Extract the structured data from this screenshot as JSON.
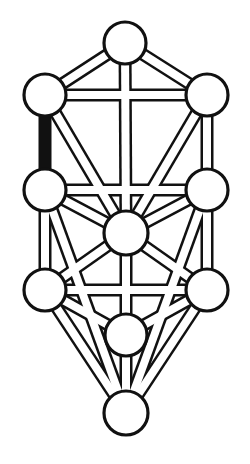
{
  "diagram": {
    "type": "kabbalistic-tree-of-life",
    "background_color": "#ffffff",
    "stroke_color": "#111111",
    "fill_color": "#ffffff",
    "highlight_color": "#111111",
    "canvas": {
      "width": 250,
      "height": 464
    },
    "node_radius": 20,
    "node_radius_bottom": 22,
    "path_outer_width": 13,
    "path_inner_width": 8,
    "node_stroke_width": 3.2,
    "path_stroke_width": 2.6
  },
  "nodes": [
    {
      "id": "kether",
      "label": "Kether",
      "number": 1,
      "cx": 125,
      "cy": 43,
      "r": 21,
      "pillar": "middle"
    },
    {
      "id": "chokmah",
      "label": "Chokmah",
      "number": 2,
      "cx": 207,
      "cy": 95,
      "r": 21,
      "pillar": "right"
    },
    {
      "id": "binah",
      "label": "Binah",
      "number": 3,
      "cx": 45,
      "cy": 95,
      "r": 21,
      "pillar": "left"
    },
    {
      "id": "chesed",
      "label": "Chesed",
      "number": 4,
      "cx": 207,
      "cy": 190,
      "r": 21,
      "pillar": "right"
    },
    {
      "id": "geburah",
      "label": "Geburah",
      "number": 5,
      "cx": 45,
      "cy": 190,
      "r": 21,
      "pillar": "left"
    },
    {
      "id": "tiphereth",
      "label": "Tiphereth",
      "number": 6,
      "cx": 126,
      "cy": 233,
      "r": 22,
      "pillar": "middle"
    },
    {
      "id": "netzach",
      "label": "Netzach",
      "number": 7,
      "cx": 207,
      "cy": 290,
      "r": 21,
      "pillar": "right"
    },
    {
      "id": "hod",
      "label": "Hod",
      "number": 8,
      "cx": 45,
      "cy": 290,
      "r": 21,
      "pillar": "left"
    },
    {
      "id": "yesod",
      "label": "Yesod",
      "number": 9,
      "cx": 126,
      "cy": 335,
      "r": 21,
      "pillar": "middle"
    },
    {
      "id": "malkuth",
      "label": "Malkuth",
      "number": 10,
      "cx": 126,
      "cy": 413,
      "r": 22,
      "pillar": "middle"
    }
  ],
  "paths": [
    {
      "id": "p-kether-binah",
      "from": "kether",
      "to": "binah",
      "highlighted": false
    },
    {
      "id": "p-kether-chokmah",
      "from": "kether",
      "to": "chokmah",
      "highlighted": false
    },
    {
      "id": "p-kether-tiphereth",
      "from": "kether",
      "to": "tiphereth",
      "highlighted": false
    },
    {
      "id": "p-binah-chokmah",
      "from": "binah",
      "to": "chokmah",
      "highlighted": false
    },
    {
      "id": "p-binah-geburah",
      "from": "binah",
      "to": "geburah",
      "highlighted": true
    },
    {
      "id": "p-binah-tiphereth",
      "from": "binah",
      "to": "tiphereth",
      "highlighted": false
    },
    {
      "id": "p-chokmah-chesed",
      "from": "chokmah",
      "to": "chesed",
      "highlighted": false
    },
    {
      "id": "p-chokmah-tiphereth",
      "from": "chokmah",
      "to": "tiphereth",
      "highlighted": false
    },
    {
      "id": "p-geburah-chesed",
      "from": "geburah",
      "to": "chesed",
      "highlighted": false
    },
    {
      "id": "p-geburah-tiphereth",
      "from": "geburah",
      "to": "tiphereth",
      "highlighted": false
    },
    {
      "id": "p-geburah-hod",
      "from": "geburah",
      "to": "hod",
      "highlighted": false
    },
    {
      "id": "p-chesed-tiphereth",
      "from": "chesed",
      "to": "tiphereth",
      "highlighted": false
    },
    {
      "id": "p-chesed-netzach",
      "from": "chesed",
      "to": "netzach",
      "highlighted": false
    },
    {
      "id": "p-tiphereth-hod",
      "from": "tiphereth",
      "to": "hod",
      "highlighted": false
    },
    {
      "id": "p-tiphereth-netzach",
      "from": "tiphereth",
      "to": "netzach",
      "highlighted": false
    },
    {
      "id": "p-tiphereth-yesod",
      "from": "tiphereth",
      "to": "yesod",
      "highlighted": false
    },
    {
      "id": "p-hod-netzach",
      "from": "hod",
      "to": "netzach",
      "highlighted": false
    },
    {
      "id": "p-hod-yesod",
      "from": "hod",
      "to": "yesod",
      "highlighted": false
    },
    {
      "id": "p-hod-malkuth",
      "from": "hod",
      "to": "malkuth",
      "highlighted": false
    },
    {
      "id": "p-netzach-yesod",
      "from": "netzach",
      "to": "yesod",
      "highlighted": false
    },
    {
      "id": "p-netzach-malkuth",
      "from": "netzach",
      "to": "malkuth",
      "highlighted": false
    },
    {
      "id": "p-yesod-malkuth",
      "from": "yesod",
      "to": "malkuth",
      "highlighted": false
    },
    {
      "id": "p-geburah-malkuth",
      "from": "geburah",
      "to": "malkuth",
      "highlighted": false
    },
    {
      "id": "p-chesed-malkuth",
      "from": "chesed",
      "to": "malkuth",
      "highlighted": false
    }
  ]
}
